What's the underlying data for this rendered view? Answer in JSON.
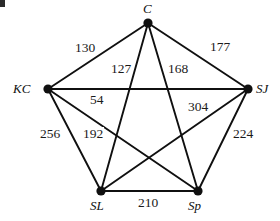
{
  "figure": {
    "type": "weighted-complete-graph",
    "width": 280,
    "height": 221,
    "background_color": "#ffffff",
    "stroke_color": "#101010",
    "vertex_color": "#101010"
  },
  "vertices": [
    {
      "id": "C",
      "label": "C",
      "x": 148,
      "y": 23,
      "label_x": 143,
      "label_y": 2,
      "label_position": "above"
    },
    {
      "id": "KC",
      "label": "KC",
      "x": 48,
      "y": 89,
      "label_x": 13,
      "label_y": 82,
      "label_position": "left"
    },
    {
      "id": "SJ",
      "label": "SJ",
      "x": 248,
      "y": 89,
      "label_x": 256,
      "label_y": 82,
      "label_position": "right"
    },
    {
      "id": "SL",
      "label": "SL",
      "x": 101,
      "y": 191,
      "label_x": 90,
      "label_y": 199,
      "label_position": "below"
    },
    {
      "id": "Sp",
      "label": "Sp",
      "x": 198,
      "y": 191,
      "label_x": 188,
      "label_y": 199,
      "label_position": "below"
    }
  ],
  "edges": [
    {
      "from": "C",
      "to": "KC",
      "weight": "130",
      "label_x": 74,
      "label_y": 41
    },
    {
      "from": "C",
      "to": "SJ",
      "weight": "177",
      "label_x": 209,
      "label_y": 40
    },
    {
      "from": "C",
      "to": "SL",
      "weight": "127",
      "label_x": 110,
      "label_y": 62
    },
    {
      "from": "C",
      "to": "Sp",
      "weight": "168",
      "label_x": 167,
      "label_y": 62
    },
    {
      "from": "KC",
      "to": "SJ",
      "weight": "54",
      "label_x": 89,
      "label_y": 93
    },
    {
      "from": "KC",
      "to": "SL",
      "weight": "256",
      "label_x": 39,
      "label_y": 127
    },
    {
      "from": "KC",
      "to": "Sp",
      "weight": "192",
      "label_x": 82,
      "label_y": 127
    },
    {
      "from": "SJ",
      "to": "SL",
      "weight": "304",
      "label_x": 187,
      "label_y": 100
    },
    {
      "from": "SJ",
      "to": "Sp",
      "weight": "224",
      "label_x": 232,
      "label_y": 127
    },
    {
      "from": "SL",
      "to": "Sp",
      "weight": "210",
      "label_x": 137,
      "label_y": 196
    }
  ]
}
